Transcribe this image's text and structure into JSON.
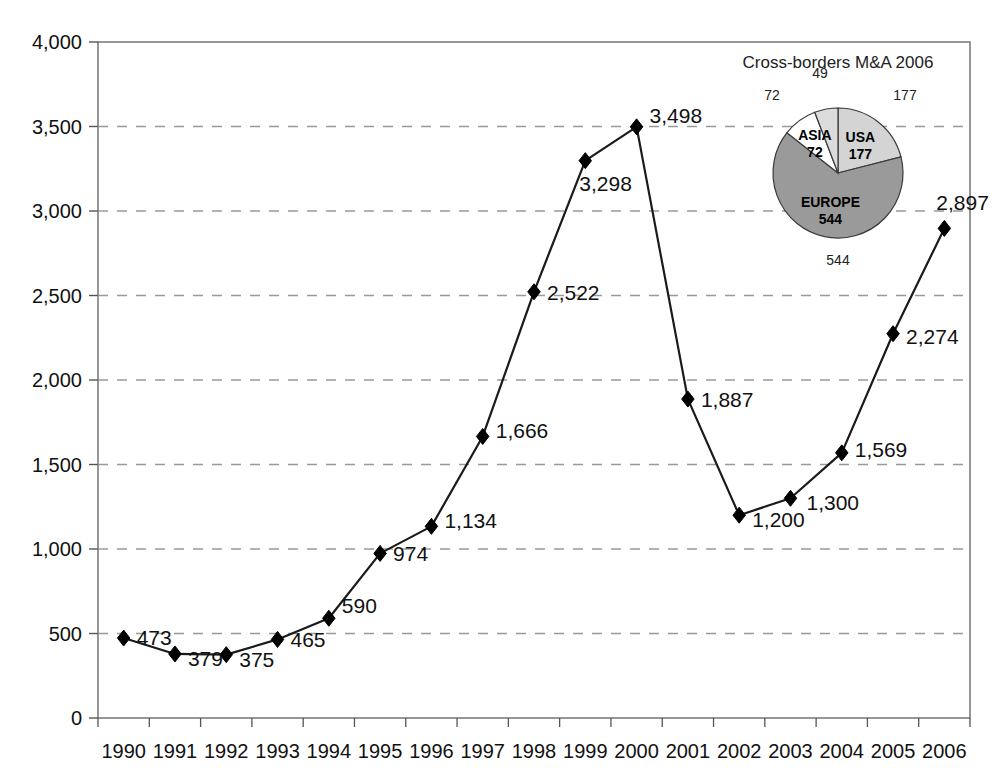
{
  "chart_data": {
    "type": "line",
    "title": "",
    "xlabel": "",
    "ylabel": "",
    "ylim": [
      0,
      4000
    ],
    "ytick_values": [
      0,
      500,
      1000,
      1500,
      2000,
      2500,
      3000,
      3500,
      4000
    ],
    "ytick_labels": [
      "0",
      "500",
      "1,000",
      "1,500",
      "2,000",
      "2,500",
      "3,000",
      "3,500",
      "4,000"
    ],
    "grid": "horizontal-dashed",
    "legend": "none",
    "marker": "diamond",
    "line_color": "#1a1a1a",
    "marker_color": "#000000",
    "grid_color": "#999999",
    "axis_color": "#555555",
    "categories": [
      "1990",
      "1991",
      "1992",
      "1993",
      "1994",
      "1995",
      "1996",
      "1997",
      "1998",
      "1999",
      "2000",
      "2001",
      "2002",
      "2003",
      "2004",
      "2005",
      "2006"
    ],
    "values": [
      473,
      379,
      375,
      465,
      590,
      974,
      1134,
      1666,
      2522,
      3298,
      3498,
      1887,
      1200,
      1300,
      1569,
      2274,
      2897
    ],
    "value_labels": [
      "473",
      "379",
      "375",
      "465",
      "590",
      "974",
      "1,134",
      "1,666",
      "2,522",
      "3,298",
      "3,498",
      "1,887",
      "1,200",
      "1,300",
      "1,569",
      "2,274",
      "2,897"
    ]
  },
  "inset_chart": {
    "type": "pie",
    "title": "Cross-borders M&A 2006",
    "total": 842,
    "slices": [
      {
        "name": "USA",
        "value": 177,
        "label": "177",
        "outer_label": "177",
        "color": "#d4d4d4"
      },
      {
        "name": "EUROPE",
        "value": 544,
        "label": "544",
        "outer_label": "544",
        "color": "#9a9a9a"
      },
      {
        "name": "ASIA",
        "value": 72,
        "label": "72",
        "outer_label": "72",
        "color": "#ffffff"
      },
      {
        "name": "",
        "value": 49,
        "label": "",
        "outer_label": "49",
        "color": "#dcdcdc"
      }
    ]
  }
}
